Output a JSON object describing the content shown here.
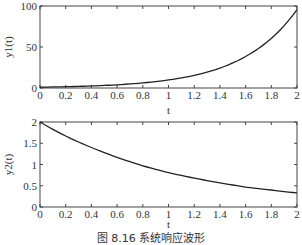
{
  "caption": "图 8.16   系统响应波形",
  "chart_data": [
    {
      "type": "line",
      "title": "",
      "xlabel": "t",
      "ylabel": "y1(t)",
      "xlim": [
        0,
        2
      ],
      "ylim": [
        0,
        100
      ],
      "xticks": [
        "0",
        "0.2",
        "0.4",
        "0.6",
        "0.8",
        "1",
        "1.2",
        "1.4",
        "1.6",
        "1.8",
        "2"
      ],
      "yticks": [
        "0",
        "50",
        "100"
      ],
      "grid": false,
      "series": [
        {
          "name": "y1(t)",
          "x": [
            0,
            0.2,
            0.4,
            0.6,
            0.8,
            1.0,
            1.2,
            1.4,
            1.6,
            1.8,
            2.0
          ],
          "values": [
            1.0,
            1.6,
            2.5,
            3.9,
            6.2,
            9.8,
            15.4,
            24.3,
            38.4,
            60.5,
            95.6
          ]
        }
      ]
    },
    {
      "type": "line",
      "title": "",
      "xlabel": "t",
      "ylabel": "y2(t)",
      "xlim": [
        0,
        2
      ],
      "ylim": [
        0,
        2
      ],
      "xticks": [
        "0",
        "0.2",
        "0.4",
        "0.6",
        "0.8",
        "1",
        "1.2",
        "1.4",
        "1.6",
        "1.8",
        "2"
      ],
      "yticks": [
        "0",
        "0.5",
        "1",
        "1.5",
        "2"
      ],
      "grid": false,
      "series": [
        {
          "name": "y2(t)",
          "x": [
            0,
            0.2,
            0.4,
            0.6,
            0.8,
            1.0,
            1.2,
            1.4,
            1.6,
            1.8,
            2.0
          ],
          "values": [
            2.0,
            1.67,
            1.4,
            1.17,
            0.97,
            0.81,
            0.68,
            0.57,
            0.47,
            0.4,
            0.33
          ]
        }
      ]
    }
  ]
}
